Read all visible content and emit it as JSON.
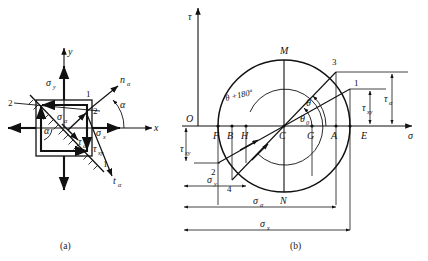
{
  "figure": {
    "caption_a": "(a)",
    "caption_b": "(b)"
  },
  "panel_a": {
    "name": "stress-element",
    "axes": {
      "x": "x",
      "y": "y"
    },
    "stresses": {
      "sigma_x": "σ",
      "sigma_x_sub": "x",
      "sigma_y": "σ",
      "sigma_y_sub": "y",
      "sigma_alpha": "σ",
      "sigma_alpha_sub": "α",
      "tau_xy": "τ",
      "tau_xy_sub": "xy",
      "tau_alpha": "τ",
      "tau_alpha_sub": "α"
    },
    "normal_dir": "n",
    "normal_dir_sub": "α",
    "tangent_dir": "t",
    "tangent_dir_sub": "α",
    "angle": "α",
    "section_labels": [
      "1",
      "1",
      "2",
      "2"
    ]
  },
  "panel_b": {
    "name": "mohrs-circle",
    "axes": {
      "sigma": "σ",
      "tau": "τ",
      "origin": "O"
    },
    "points": [
      {
        "id": "F",
        "label": "F"
      },
      {
        "id": "B",
        "label": "B"
      },
      {
        "id": "H",
        "label": "H"
      },
      {
        "id": "C",
        "label": "C"
      },
      {
        "id": "G",
        "label": "G"
      },
      {
        "id": "A",
        "label": "A"
      },
      {
        "id": "E",
        "label": "E"
      },
      {
        "id": "M",
        "label": "M"
      },
      {
        "id": "N",
        "label": "N"
      }
    ],
    "numbered_points": [
      {
        "id": "1",
        "label": "1"
      },
      {
        "id": "2",
        "label": "2"
      },
      {
        "id": "3",
        "label": "3"
      },
      {
        "id": "4",
        "label": "4"
      }
    ],
    "angles": {
      "theta": "θ",
      "theta0": "θ",
      "theta0_sub": "0",
      "theta_plus": "θ +180º"
    },
    "dimensions": {
      "tau_xy": "τ",
      "tau_xy_sub": "xy",
      "tau_alpha": "τ",
      "tau_alpha_sub": "α",
      "sigma_y": "σ",
      "sigma_y_sub": "y",
      "sigma_alpha": "σ",
      "sigma_alpha_sub": "α",
      "sigma_x": "σ",
      "sigma_x_sub": "x"
    }
  },
  "colors": {
    "ink": "#111111",
    "bg": "#ffffff"
  }
}
